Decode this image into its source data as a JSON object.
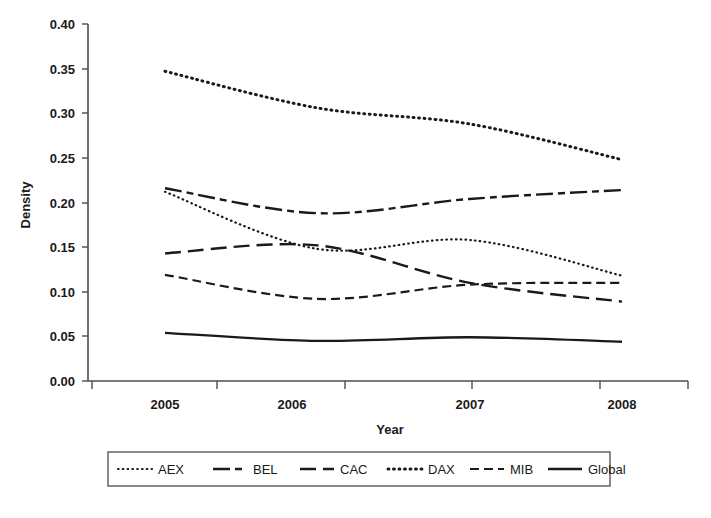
{
  "chart_data": {
    "type": "line",
    "title": "",
    "xlabel": "Year",
    "ylabel": "Density",
    "x": [
      2005,
      2006,
      2007,
      2008
    ],
    "categories": [
      "2005",
      "2006",
      "2007",
      "2008"
    ],
    "xlim": [
      2004.6,
      2008.4
    ],
    "ylim": [
      0.0,
      0.4
    ],
    "ytick_labels": [
      "0.00",
      "0.05",
      "0.10",
      "0.15",
      "0.20",
      "0.25",
      "0.30",
      "0.35",
      "0.40"
    ],
    "ytick_values": [
      0.0,
      0.05,
      0.1,
      0.15,
      0.2,
      0.25,
      0.3,
      0.35,
      0.4
    ],
    "xtick_labels": [
      "2005",
      "2006",
      "2007",
      "2008"
    ],
    "grid": false,
    "legend_position": "below-plot",
    "series": [
      {
        "name": "AEX",
        "style": "dotted-fine",
        "values": [
          0.212,
          0.148,
          0.158,
          0.118
        ]
      },
      {
        "name": "BEL",
        "style": "dash-dot-dot",
        "values": [
          0.216,
          0.188,
          0.204,
          0.214
        ]
      },
      {
        "name": "CAC",
        "style": "long-dash",
        "values": [
          0.143,
          0.152,
          0.11,
          0.089
        ]
      },
      {
        "name": "DAX",
        "style": "dotted-bold",
        "values": [
          0.347,
          0.306,
          0.288,
          0.248
        ]
      },
      {
        "name": "MIB",
        "style": "dashed",
        "values": [
          0.119,
          0.092,
          0.108,
          0.11
        ]
      },
      {
        "name": "Global",
        "style": "solid",
        "values": [
          0.054,
          0.045,
          0.049,
          0.044
        ]
      }
    ],
    "series_color": "#1a1a1a"
  },
  "axes": {
    "y_title": "Density",
    "x_title": "Year",
    "ytick_0": "0.00",
    "ytick_1": "0.05",
    "ytick_2": "0.10",
    "ytick_3": "0.15",
    "ytick_4": "0.20",
    "ytick_5": "0.25",
    "ytick_6": "0.30",
    "ytick_7": "0.35",
    "ytick_8": "0.40",
    "xtick_0": "2005",
    "xtick_1": "2006",
    "xtick_2": "2007",
    "xtick_3": "2008"
  },
  "legend": {
    "items": [
      {
        "label": "AEX"
      },
      {
        "label": "BEL"
      },
      {
        "label": "CAC"
      },
      {
        "label": "DAX"
      },
      {
        "label": "MIB"
      },
      {
        "label": "Global"
      }
    ]
  }
}
